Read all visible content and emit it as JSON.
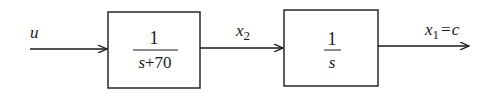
{
  "diagram": {
    "type": "block-diagram",
    "input_signal": "u",
    "blocks": [
      {
        "id": "block-1",
        "numerator": "1",
        "denominator": "s+70"
      },
      {
        "id": "block-2",
        "numerator": "1",
        "denominator": "s"
      }
    ],
    "signals": [
      {
        "id": "u",
        "label": "u"
      },
      {
        "id": "x2",
        "label_base": "x",
        "label_sub": "2"
      },
      {
        "id": "x1",
        "label_base": "x",
        "label_sub": "1",
        "label_suffix": "= c"
      }
    ],
    "colors": {
      "stroke": "#1a1a1a",
      "background": "#ffffff"
    }
  }
}
